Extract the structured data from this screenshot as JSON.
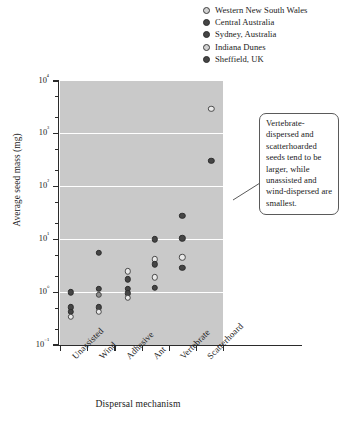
{
  "legend": {
    "items": [
      {
        "label": "Western New South Wales",
        "style": "hollow"
      },
      {
        "label": "Central Australia",
        "style": "filled"
      },
      {
        "label": "Sydney, Australia",
        "style": "filled"
      },
      {
        "label": "Indiana Dunes",
        "style": "hollow"
      },
      {
        "label": "Sheffield, UK",
        "style": "filled"
      }
    ]
  },
  "annotation": {
    "text": "Vertebrate-dispersed and scatterhoarded seeds tend to be larger, while unassisted and wind-dispersed are smallest."
  },
  "colors": {
    "plot_background": "#c9c9c9",
    "gridline": "#ffffff",
    "marker_filled": "#454545",
    "marker_hollow": "#e9e9e9",
    "axis": "#2b2b2b"
  },
  "chart_data": {
    "type": "scatter",
    "title": "",
    "xlabel": "Dispersal mechanism",
    "ylabel": "Average seed mass (mg)",
    "yscale": "log",
    "ylim": [
      0.1,
      10000
    ],
    "ytick_labels": [
      "10⁴",
      "10³",
      "10²",
      "10¹",
      "10⁰",
      "10⁻¹"
    ],
    "ytick_values": [
      10000,
      1000,
      100,
      10,
      1,
      0.1
    ],
    "grid": "horizontal",
    "legend_position": "top-right",
    "categories": [
      "Unassisted",
      "Wind",
      "Adhesive",
      "Ant",
      "Vertebrate",
      "Scatterhoard"
    ],
    "points": [
      {
        "category": "Unassisted",
        "value": 1.0,
        "style": "filled",
        "dx": -3
      },
      {
        "category": "Unassisted",
        "value": 0.52,
        "style": "filled",
        "dx": -3
      },
      {
        "category": "Unassisted",
        "value": 0.42,
        "style": "filled",
        "dx": -3
      },
      {
        "category": "Unassisted",
        "value": 0.34,
        "style": "hollow",
        "dx": -3
      },
      {
        "category": "Wind",
        "value": 5.5,
        "style": "filled",
        "dx": -2
      },
      {
        "category": "Wind",
        "value": 1.15,
        "style": "filled",
        "dx": -2
      },
      {
        "category": "Wind",
        "value": 0.9,
        "style": "mid",
        "dx": -2
      },
      {
        "category": "Wind",
        "value": 0.52,
        "style": "filled",
        "dx": -2
      },
      {
        "category": "Wind",
        "value": 0.42,
        "style": "hollow",
        "dx": -2
      },
      {
        "category": "Adhesive",
        "value": 2.5,
        "style": "hollow",
        "dx": 0
      },
      {
        "category": "Adhesive",
        "value": 1.75,
        "style": "filled",
        "dx": 0
      },
      {
        "category": "Adhesive",
        "value": 1.15,
        "style": "filled",
        "dx": 0
      },
      {
        "category": "Adhesive",
        "value": 0.95,
        "style": "filled",
        "dx": 0
      },
      {
        "category": "Adhesive",
        "value": 0.78,
        "style": "hollow",
        "dx": 0
      },
      {
        "category": "Ant",
        "value": 10.0,
        "style": "filled",
        "dx": 0
      },
      {
        "category": "Ant",
        "value": 4.2,
        "style": "hollow",
        "dx": 0
      },
      {
        "category": "Ant",
        "value": 3.4,
        "style": "filled",
        "dx": 0
      },
      {
        "category": "Ant",
        "value": 1.9,
        "style": "hollow",
        "dx": 0
      },
      {
        "category": "Ant",
        "value": 1.2,
        "style": "filled",
        "dx": 0
      },
      {
        "category": "Vertebrate",
        "value": 28.0,
        "style": "filled",
        "dx": 0
      },
      {
        "category": "Vertebrate",
        "value": 10.5,
        "style": "filled",
        "dx": 0
      },
      {
        "category": "Vertebrate",
        "value": 4.6,
        "style": "hollow",
        "dx": 0
      },
      {
        "category": "Vertebrate",
        "value": 2.9,
        "style": "filled",
        "dx": 0
      },
      {
        "category": "Scatterhoard",
        "value": 3000.0,
        "style": "hollow",
        "dx": 2
      },
      {
        "category": "Scatterhoard",
        "value": 310.0,
        "style": "filled",
        "dx": 2
      }
    ]
  }
}
